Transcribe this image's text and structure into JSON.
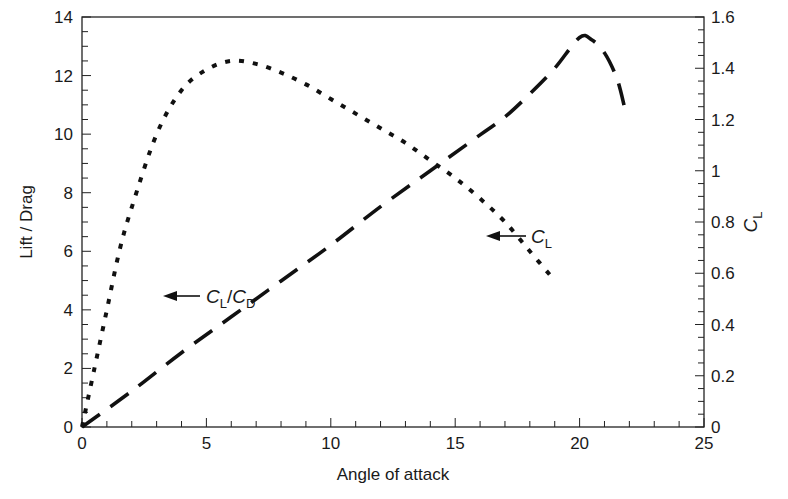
{
  "chart_data": {
    "type": "line",
    "title": "",
    "xlabel": "Angle of attack",
    "ylabel": "Lift / Drag",
    "y2label": "C_L",
    "xlim": [
      0,
      25
    ],
    "ylim": [
      0,
      14
    ],
    "y2lim": [
      0,
      1.6
    ],
    "x_ticks": [
      "0",
      "5",
      "10",
      "15",
      "20",
      "25"
    ],
    "y_ticks": [
      "0",
      "2",
      "4",
      "6",
      "8",
      "10",
      "12",
      "14"
    ],
    "y2_ticks": [
      "0",
      "0.2",
      "0.4",
      "0.6",
      "0.8",
      "1",
      "1.2",
      "1.4",
      "1.6"
    ],
    "grid": false,
    "legend": "none (inline arrow annotations)",
    "series": [
      {
        "name": "C_L/C_D",
        "axis": "left",
        "style": "dotted",
        "x": [
          0,
          0.5,
          1,
          1.5,
          2,
          3,
          4,
          5,
          6,
          7,
          8,
          9,
          10,
          11,
          12,
          13,
          14,
          15,
          16,
          17,
          18,
          19
        ],
        "values": [
          0,
          2.0,
          4.0,
          6.0,
          7.5,
          10.0,
          11.5,
          12.2,
          12.5,
          12.4,
          12.1,
          11.7,
          11.2,
          10.7,
          10.2,
          9.7,
          9.1,
          8.5,
          7.8,
          7.0,
          6.0,
          5.0
        ]
      },
      {
        "name": "C_L",
        "axis": "right",
        "style": "dashed",
        "x": [
          0,
          2,
          4,
          6,
          8,
          10,
          12,
          14,
          16,
          17,
          18,
          19,
          20,
          20.5,
          21,
          21.5,
          21.8
        ],
        "values": [
          0,
          0.14,
          0.29,
          0.43,
          0.57,
          0.71,
          0.86,
          1.0,
          1.14,
          1.21,
          1.3,
          1.4,
          1.52,
          1.51,
          1.46,
          1.36,
          1.25
        ]
      }
    ],
    "annotations": [
      {
        "text": "C_L/C_D",
        "main": "C",
        "sub1": "L",
        "slash": "/",
        "main2": "C",
        "sub2": "D",
        "arrow": "left",
        "x_deg": 4.5,
        "y_ld": 4.5
      },
      {
        "text": "C_L",
        "main": "C",
        "sub1": "L",
        "arrow": "left",
        "x_deg": 18.8,
        "y_ld": 6.7
      }
    ]
  },
  "labels": {
    "xlabel": "Angle of attack",
    "ylabel": "Lift / Drag",
    "y2label_main": "C",
    "y2label_sub": "L",
    "annot1_c1": "C",
    "annot1_s1": "L",
    "annot1_slash": "/",
    "annot1_c2": "C",
    "annot1_s2": "D",
    "annot2_c": "C",
    "annot2_s": "L"
  },
  "colors": {
    "ink": "#111111",
    "background": "#ffffff"
  }
}
